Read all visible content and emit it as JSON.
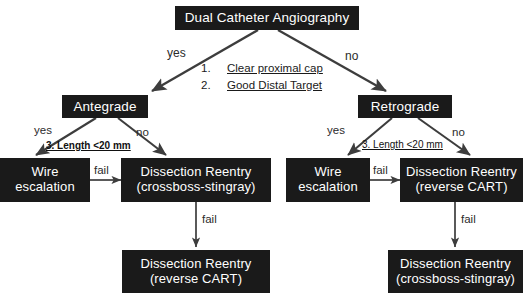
{
  "diagram": {
    "title_node": {
      "lines": [
        "Dual Catheter Angiography"
      ]
    },
    "branch_left": {
      "lines": [
        "Antegrade"
      ]
    },
    "branch_right": {
      "lines": [
        "Retrograde"
      ]
    },
    "left_wire": {
      "lines": [
        "Wire",
        "escalation"
      ]
    },
    "left_reentry": {
      "lines": [
        "Dissection Reentry",
        "(crossboss-stingray)"
      ]
    },
    "left_bottom": {
      "lines": [
        "Dissection Reentry",
        "(reverse CART)"
      ]
    },
    "right_wire": {
      "lines": [
        "Wire",
        "escalation"
      ]
    },
    "right_reentry": {
      "lines": [
        "Dissection Reentry",
        "(reverse CART)"
      ]
    },
    "right_bottom": {
      "lines": [
        "Dissection Reentry",
        "(crossboss-stingray)"
      ]
    }
  },
  "criteria": {
    "items": [
      {
        "index": "1.",
        "text": "Clear proximal cap"
      },
      {
        "index": "2.",
        "text": "Good Distal Target"
      }
    ],
    "length_rule_left": "3.  Length <20 mm",
    "length_rule_right": "3.  Length <20 mm"
  },
  "edges": {
    "top_yes": "yes",
    "top_no": "no",
    "left_yes": "yes",
    "left_no": "no",
    "right_yes": "yes",
    "right_no": "no",
    "left_fail_h": "fail",
    "left_fail_v": "fail",
    "right_fail_h": "fail",
    "right_fail_v": "fail"
  },
  "colors": {
    "node_fill": "#1a1a1a",
    "node_text": "#ffffff",
    "arrow": "#3d3d3d",
    "background": "#ffffff"
  }
}
